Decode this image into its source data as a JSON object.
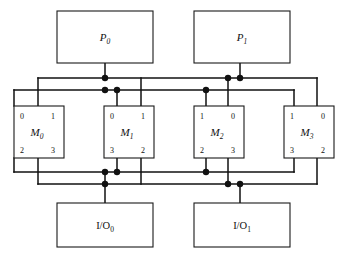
{
  "diagram": {
    "background_color": "#ffffff",
    "line_color": "#111111",
    "box_fill": "#ffffff",
    "box_stroke": "#1a1a1a"
  },
  "processors": [
    {
      "id": "P0",
      "label": "P",
      "sub": "0",
      "x": 57,
      "y": 11,
      "w": 96,
      "h": 52
    },
    {
      "id": "P1",
      "label": "P",
      "sub": "1",
      "x": 194,
      "y": 11,
      "w": 96,
      "h": 52
    }
  ],
  "memories": [
    {
      "id": "M0",
      "label": "M",
      "sub": "0",
      "x": 14,
      "y": 106,
      "w": 50,
      "h": 52,
      "ports": {
        "top_left": "0",
        "top_right": "1",
        "bottom_left": "2",
        "bottom_right": "3"
      }
    },
    {
      "id": "M1",
      "label": "M",
      "sub": "1",
      "x": 104,
      "y": 106,
      "w": 50,
      "h": 52,
      "ports": {
        "top_left": "0",
        "top_right": "1",
        "bottom_left": "3",
        "bottom_right": "2"
      }
    },
    {
      "id": "M2",
      "label": "M",
      "sub": "2",
      "x": 194,
      "y": 106,
      "w": 50,
      "h": 52,
      "ports": {
        "top_left": "1",
        "top_right": "0",
        "bottom_left": "2",
        "bottom_right": "3"
      }
    },
    {
      "id": "M3",
      "label": "M",
      "sub": "3",
      "x": 284,
      "y": 106,
      "w": 50,
      "h": 52,
      "ports": {
        "top_left": "1",
        "top_right": "0",
        "bottom_left": "3",
        "bottom_right": "2"
      }
    }
  ],
  "io_units": [
    {
      "id": "IO0",
      "label": "I/O",
      "sub": "0",
      "x": 57,
      "y": 203,
      "w": 96,
      "h": 44
    },
    {
      "id": "IO1",
      "label": "I/O",
      "sub": "1",
      "x": 194,
      "y": 203,
      "w": 96,
      "h": 44
    }
  ],
  "buses": {
    "top_upper_y": 78,
    "top_lower_y": 90,
    "bottom_upper_y": 172,
    "bottom_lower_y": 184
  },
  "junction_dots": [
    {
      "x": 105,
      "y": 78
    },
    {
      "x": 228,
      "y": 78
    },
    {
      "x": 240,
      "y": 78
    },
    {
      "x": 105,
      "y": 90
    },
    {
      "x": 117,
      "y": 90
    },
    {
      "x": 206,
      "y": 90
    },
    {
      "x": 105,
      "y": 172
    },
    {
      "x": 117,
      "y": 172
    },
    {
      "x": 206,
      "y": 172
    },
    {
      "x": 105,
      "y": 184
    },
    {
      "x": 228,
      "y": 184
    },
    {
      "x": 240,
      "y": 184
    }
  ]
}
